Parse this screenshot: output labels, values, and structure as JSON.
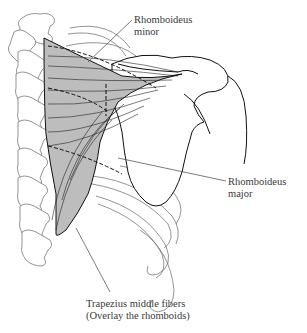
{
  "figure": {
    "type": "anatomical-diagram",
    "colors": {
      "muscle_fill": "#bdbdbd",
      "outline": "#1a1a1a",
      "bone_outline": "#555555",
      "leader_line": "#444444",
      "text": "#3a3a3a"
    }
  },
  "labels": {
    "rhomboideus_minor": {
      "line1": "Rhomboideus",
      "line2": "minor"
    },
    "rhomboideus_major": {
      "line1": "Rhomboideus",
      "line2": "major"
    },
    "trapezius": {
      "line1": "Trapezius middle fibers",
      "line2": "(Overlay the rhomboids)"
    }
  }
}
